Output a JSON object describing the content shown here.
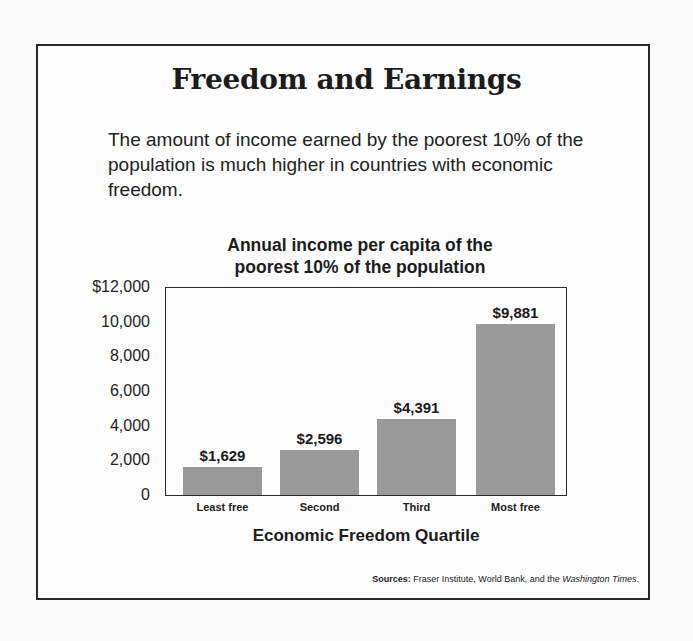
{
  "header": {
    "title": "Freedom and Earnings",
    "subtitle": "The amount of income earned by the poorest 10% of the population is much higher in countries with economic freedom."
  },
  "footer": {
    "sources_label": "Sources:",
    "sources_text": " Fraser Institute, World Bank, and the ",
    "sources_italic": "Washington Times",
    "sources_end": "."
  },
  "chart_data": {
    "type": "bar",
    "title": "Annual income per capita of the poorest 10% of the population",
    "title_lines": [
      "Annual income per capita of the",
      "poorest 10% of the population"
    ],
    "xlabel": "Economic Freedom Quartile",
    "ylabel": "",
    "categories": [
      "Least free",
      "Second",
      "Third",
      "Most free"
    ],
    "values": [
      1629,
      2596,
      4391,
      9881
    ],
    "value_labels": [
      "$1,629",
      "$2,596",
      "$4,391",
      "$9,881"
    ],
    "ylim": [
      0,
      12000
    ],
    "yticks": [
      0,
      2000,
      4000,
      6000,
      8000,
      10000,
      12000
    ],
    "ytick_labels": [
      "0",
      "2,000",
      "4,000",
      "6,000",
      "8,000",
      "10,000",
      "$12,000"
    ],
    "grid": false,
    "legend": null,
    "bar_color": "#9a9a9a"
  }
}
